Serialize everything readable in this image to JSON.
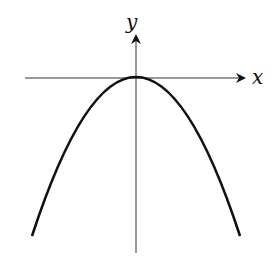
{
  "diagram": {
    "x_axis_label": "x",
    "y_axis_label": "y",
    "curve": {
      "type": "parabola",
      "equation_shape": "y = -a x^2",
      "vertex": "origin",
      "opens": "down"
    },
    "colors": {
      "curve": "#111111",
      "axes": "#333333",
      "background": "#ffffff"
    }
  }
}
